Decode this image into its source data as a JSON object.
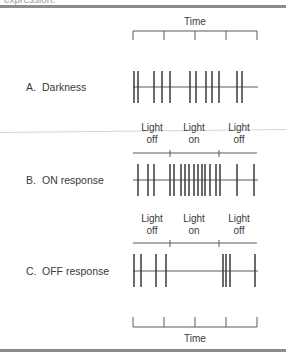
{
  "header": {
    "cut_text": "expression."
  },
  "colors": {
    "ink": "#3a3a3a",
    "rule": "#8c8c8c",
    "baseline": "#5a5a5a"
  },
  "time_scale_top": {
    "label": "Time",
    "ticks_x": [
      133,
      164,
      195,
      226,
      257
    ]
  },
  "time_scale_bottom": {
    "label": "Time",
    "ticks_x": [
      133,
      164,
      195,
      226,
      257
    ]
  },
  "stimulus_labels": {
    "light_off": [
      "Light",
      "off"
    ],
    "light_on": [
      "Light",
      "on"
    ]
  },
  "panels": [
    {
      "id": "A",
      "letter": "A.",
      "title": "Darkness",
      "baseline_y": 87,
      "spike_top": 71,
      "spike_bottom": 103,
      "spikes_x": [
        134,
        138,
        154,
        162,
        170,
        190,
        196,
        206,
        212,
        219,
        237,
        242
      ]
    },
    {
      "id": "B",
      "letter": "B.",
      "title": "ON response",
      "baseline_y": 180,
      "spike_top": 164,
      "spike_bottom": 196,
      "stimulus_ticks_x": [
        170,
        219
      ],
      "stimulus_line_y": 153,
      "spikes_x": [
        138,
        148,
        154,
        170,
        174,
        181,
        185,
        189,
        194,
        198,
        202,
        205,
        210,
        216,
        220,
        237,
        254
      ]
    },
    {
      "id": "C",
      "letter": "C.",
      "title": "OFF response",
      "baseline_y": 271,
      "spike_top": 254,
      "spike_bottom": 287,
      "stimulus_ticks_x": [
        170,
        219
      ],
      "stimulus_line_y": 243,
      "spikes_x": [
        134,
        141,
        156,
        166,
        223,
        226,
        230,
        255
      ]
    }
  ]
}
